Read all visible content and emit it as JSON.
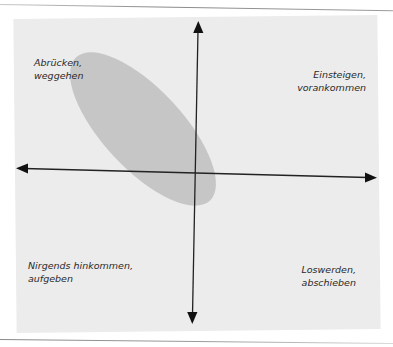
{
  "diagram": {
    "type": "quadrant",
    "quadrants": {
      "top_left": {
        "line1": "Abrücken,",
        "line2": "weggehen"
      },
      "top_right": {
        "line1": "Einsteigen,",
        "line2": "vorankommen"
      },
      "bottom_left": {
        "line1": "Nirgends hinkommen,",
        "line2": "aufgeben"
      },
      "bottom_right": {
        "line1": "Loswerden,",
        "line2": "abschieben"
      }
    },
    "axes": {
      "horizontal": {
        "arrows": "both",
        "color": "#1a1a1a"
      },
      "vertical": {
        "arrows": "both",
        "color": "#1a1a1a"
      }
    },
    "highlight_region": {
      "shape": "ellipse",
      "color": "#c4c4c4",
      "spans": [
        "top_left",
        "center"
      ]
    },
    "colors": {
      "panel_background": "#ececec",
      "page_background": "#ffffff",
      "text": "#2a2a2a"
    }
  }
}
